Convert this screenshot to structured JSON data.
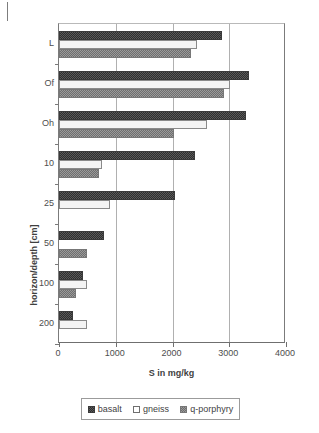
{
  "chart_data": {
    "type": "bar",
    "orientation": "horizontal",
    "title": "",
    "xlabel": "S in mg/kg",
    "ylabel": "horizon/depth [cm]",
    "xlim": [
      0,
      4000
    ],
    "xticks": [
      "0",
      "1000",
      "2000",
      "3000",
      "4000"
    ],
    "grid": "vertical gridlines at 1000, 2000, 3000",
    "legend_position": "below plot, horizontal",
    "categories": [
      "L",
      "Of",
      "Oh",
      "10",
      "25",
      "50",
      "100",
      "200"
    ],
    "series": [
      {
        "name": "basalt",
        "color": "#3a3a3a",
        "values": [
          2880,
          3350,
          3300,
          2400,
          2050,
          800,
          430,
          250
        ]
      },
      {
        "name": "gneiss",
        "color": "#f4f4f4",
        "values": [
          2440,
          3020,
          2600,
          750,
          900,
          0,
          500,
          500
        ]
      },
      {
        "name": "q-porphyry",
        "color": "#8f8f8f",
        "values": [
          2320,
          2900,
          2020,
          700,
          0,
          500,
          300,
          0
        ]
      }
    ]
  },
  "legend": {
    "items": [
      {
        "label": "basalt"
      },
      {
        "label": "gneiss"
      },
      {
        "label": "q-porphyry"
      }
    ]
  }
}
